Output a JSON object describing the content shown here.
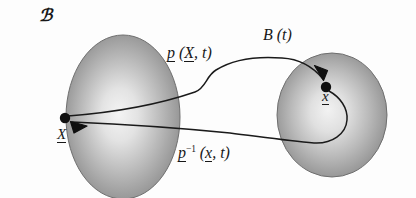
{
  "figure": {
    "width": 416,
    "height": 198,
    "background_color": "#fdfdfd"
  },
  "labels": {
    "domain_body": "ℬ",
    "image_body": "B (t)",
    "forward_map": {
      "operator": "p",
      "open_paren": " (",
      "argument": "X",
      "comma": ", ",
      "time": "t",
      "close_paren": ")",
      "full_text": "p (X, t)"
    },
    "inverse_map": {
      "operator": "p",
      "superscript": "−1",
      "open_paren": " (",
      "argument": "x",
      "comma": ", ",
      "time": "t",
      "close_paren": ")",
      "full_text": "p⁻¹ (x, t)"
    },
    "point_reference": "X",
    "point_current": "x"
  },
  "shapes": {
    "left_blob": {
      "name": "reference-configuration-blob",
      "type": "ellipse",
      "cx": 123,
      "cy": 117,
      "rx": 57,
      "ry": 82,
      "fill_center": "#f2f2f2",
      "fill_edge": "#8c8c8c",
      "stroke": "#6d6d6d"
    },
    "right_blob": {
      "name": "current-configuration-blob",
      "type": "ellipse",
      "cx": 332,
      "cy": 115,
      "rx": 55,
      "ry": 62,
      "fill_center": "#f0f0f0",
      "fill_edge": "#8a8a8a",
      "stroke": "#6d6d6d"
    },
    "dot_left": {
      "name": "reference-point-dot",
      "cx": 65,
      "cy": 118,
      "r": 5.0,
      "fill": "#101010"
    },
    "dot_right": {
      "name": "current-point-dot",
      "cx": 326,
      "cy": 87,
      "r": 5.0,
      "fill": "#101010"
    }
  },
  "curves": {
    "forward": {
      "name": "forward-motion-curve",
      "stroke": "#1a1a1a",
      "stroke_width": 1.4,
      "arrow_at": "current-point-dot"
    },
    "inverse": {
      "name": "inverse-motion-curve",
      "stroke": "#1a1a1a",
      "stroke_width": 1.4,
      "arrow_at": "reference-point-dot"
    }
  },
  "colors": {
    "ink": "#181818",
    "blob_light": "#f2f2f2",
    "blob_dark": "#8a8a8a",
    "page": "#fdfdfd"
  }
}
